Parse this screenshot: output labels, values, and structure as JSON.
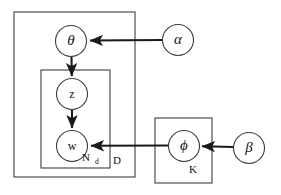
{
  "diagram": {
    "type": "probabilistic-graphical-model",
    "canvas": {
      "width": 281,
      "height": 195,
      "background": "#ffffff"
    },
    "colors": {
      "plate_stroke": "#3c3c3c",
      "node_stroke": "#3c3c3c",
      "node_fill": "#ffffff",
      "edge_stroke": "#1a1a1a",
      "text": "#111111"
    },
    "nodes": [
      {
        "id": "theta",
        "label": "θ",
        "style": "greek",
        "cx": 71,
        "cy": 41,
        "r": 15.5,
        "observed": false
      },
      {
        "id": "z",
        "label": "z",
        "style": "latin",
        "cx": 72,
        "cy": 94,
        "r": 15.5,
        "observed": false
      },
      {
        "id": "w",
        "label": "w",
        "style": "latin",
        "cx": 72,
        "cy": 146,
        "r": 15.5,
        "observed": false
      },
      {
        "id": "alpha",
        "label": "α",
        "style": "greek",
        "cx": 178,
        "cy": 40,
        "r": 15.5,
        "observed": false
      },
      {
        "id": "phi",
        "label": "ϕ",
        "style": "greek",
        "cx": 184,
        "cy": 146,
        "r": 15.5,
        "observed": false
      },
      {
        "id": "beta",
        "label": "β",
        "style": "greek",
        "cx": 249,
        "cy": 148,
        "r": 15.5,
        "observed": false
      }
    ],
    "edges": [
      {
        "id": "alpha-to-theta",
        "from": "alpha",
        "to": "theta",
        "path": "M 162.5 40 L 89 40.5"
      },
      {
        "id": "theta-to-z",
        "from": "theta",
        "to": "z",
        "path": "M 71.5 56.5 L 71.8 77"
      },
      {
        "id": "z-to-w",
        "from": "z",
        "to": "w",
        "path": "M 72 109.5 L 72 129"
      },
      {
        "id": "phi-to-w",
        "from": "phi",
        "to": "w",
        "path": "M 168.5 145.5 L 90 145.8"
      },
      {
        "id": "beta-to-phi",
        "from": "beta",
        "to": "phi",
        "path": "M 233.5 147 L 201 146.2"
      }
    ],
    "plates": [
      {
        "id": "plate-D",
        "label": "D",
        "label_sub": "",
        "x": 14,
        "y": 12,
        "width": 121,
        "height": 165,
        "label_x": 117,
        "label_y": 161
      },
      {
        "id": "plate-Nd",
        "label": "N",
        "label_sub": "d",
        "x": 41,
        "y": 70,
        "width": 69,
        "height": 98,
        "label_x": 92,
        "label_y": 158
      },
      {
        "id": "plate-K",
        "label": "K",
        "label_sub": "",
        "x": 155,
        "y": 118,
        "width": 57,
        "height": 65,
        "label_x": 193,
        "label_y": 170
      }
    ]
  }
}
